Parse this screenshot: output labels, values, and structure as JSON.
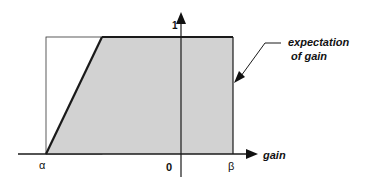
{
  "diagram": {
    "y_axis_label": "1",
    "x_axis_label": "gain",
    "tick_alpha": "α",
    "tick_zero": "0",
    "tick_beta": "β",
    "annotation_line1": "expectation",
    "annotation_line2": "of gain",
    "colors": {
      "fill": "#d2d2d2",
      "stroke": "#1a1a1a"
    }
  }
}
